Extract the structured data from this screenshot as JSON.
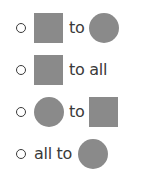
{
  "options": [
    {
      "id": "square-to-circle",
      "from_shape": "square",
      "connector": "to",
      "to_shape": "circle"
    },
    {
      "id": "square-to-all",
      "from_shape": "square",
      "connector": "to all"
    },
    {
      "id": "circle-to-square",
      "from_shape": "circle",
      "connector": "to",
      "to_shape": "square"
    },
    {
      "id": "all-to-circle",
      "prefix": "all to",
      "to_shape": "circle"
    }
  ],
  "colors": {
    "shape_fill": "#8a8a8a",
    "text": "#3a3a3a"
  }
}
